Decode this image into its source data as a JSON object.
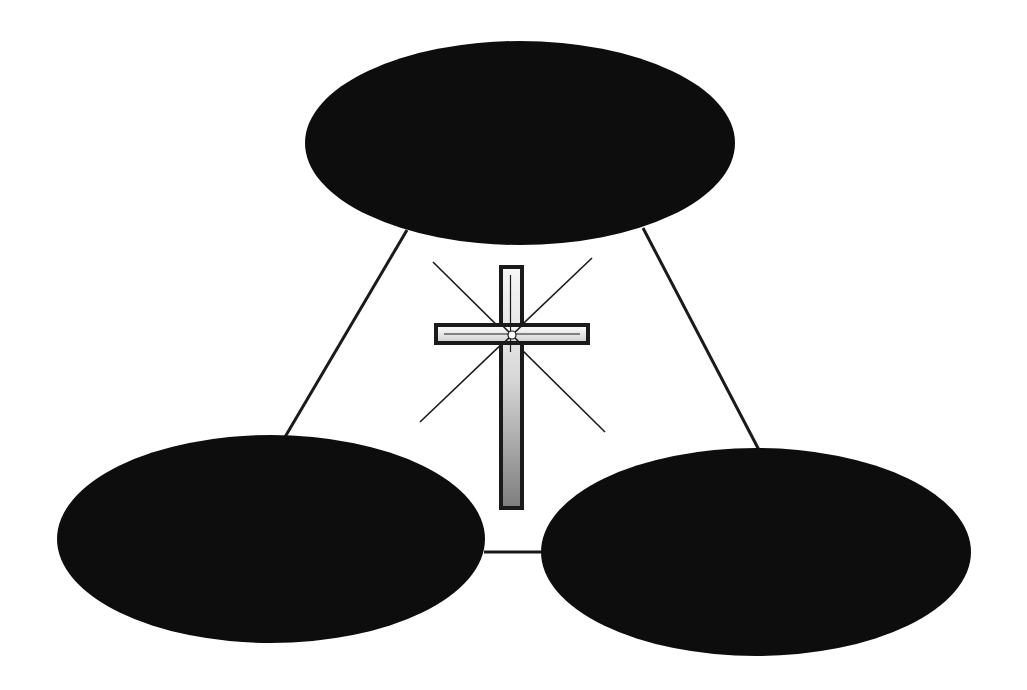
{
  "diagram": {
    "type": "triangle-of-ellipses-with-center-cross",
    "background": "#ffffff",
    "nodes": [
      {
        "id": "top",
        "label": "",
        "cx": 520,
        "cy": 143,
        "rx": 215,
        "ry": 102,
        "fill": "#0d0d0d"
      },
      {
        "id": "bottom-left",
        "label": "",
        "cx": 271,
        "cy": 539,
        "rx": 214,
        "ry": 104,
        "fill": "#0d0d0d"
      },
      {
        "id": "bottom-right",
        "label": "",
        "cx": 756,
        "cy": 552,
        "rx": 215,
        "ry": 104,
        "fill": "#0d0d0d"
      }
    ],
    "edges": [
      {
        "from": "top",
        "to": "bottom-left",
        "x1": 407,
        "y1": 230,
        "x2": 285,
        "y2": 437
      },
      {
        "from": "top",
        "to": "bottom-right",
        "x1": 643,
        "y1": 228,
        "x2": 759,
        "y2": 450
      },
      {
        "from": "bottom-left",
        "to": "bottom-right",
        "x1": 484,
        "y1": 552,
        "x2": 543,
        "y2": 552
      }
    ],
    "edge_color": "#1a1a1a",
    "center_symbol": {
      "name": "cross",
      "vertical": {
        "x": 501,
        "y": 267,
        "w": 21,
        "h": 241
      },
      "horizontal": {
        "x": 436,
        "y": 325,
        "w": 152,
        "h": 18
      },
      "center": {
        "x": 512,
        "y": 335
      },
      "rays": [
        {
          "x1": 433,
          "y1": 262,
          "x2": 605,
          "y2": 432
        },
        {
          "x1": 592,
          "y1": 258,
          "x2": 420,
          "y2": 422
        }
      ],
      "outline_color": "#1a1a1a",
      "fill_light": "#f5f5f5",
      "fill_shade": "#8a8a8a"
    }
  }
}
